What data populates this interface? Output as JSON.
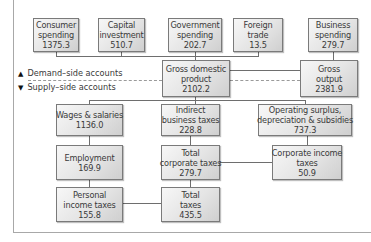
{
  "legend": {
    "demand": {
      "icon": "triangle-up-icon",
      "glyph": "▲",
      "label": "Demand–side accounts"
    },
    "supply": {
      "icon": "triangle-down-icon",
      "glyph": "▼",
      "label": "Supply–side accounts"
    }
  },
  "nodes": {
    "consumer_spending": {
      "line1": "Consumer",
      "line2": "spending",
      "value": "1375.3"
    },
    "capital_investment": {
      "line1": "Capital",
      "line2": "investment",
      "value": "510.7"
    },
    "government_spending": {
      "line1": "Government",
      "line2": "spending",
      "value": "202.7"
    },
    "foreign_trade": {
      "line1": "Foreign",
      "line2": "trade",
      "value": "13.5"
    },
    "business_spending": {
      "line1": "Business",
      "line2": "spending",
      "value": "279.7"
    },
    "gdp": {
      "line1": "Gross domestic",
      "line2": "product",
      "value": "2102.2"
    },
    "gross_output": {
      "line1": "Gross",
      "line2": "output",
      "value": "2381.9"
    },
    "wages_salaries": {
      "line1": "Wages & salaries",
      "value": "1136.0"
    },
    "indirect_business_taxes": {
      "line1": "Indirect",
      "line2": "business taxes",
      "value": "228.8"
    },
    "operating_surplus": {
      "line1": "Operating surplus,",
      "line2": "depreciation & subsidies",
      "value": "737.3"
    },
    "employment": {
      "line1": "Employment",
      "value": "169.9"
    },
    "total_corporate_taxes": {
      "line1": "Total",
      "line2": "corporate taxes",
      "value": "279.7"
    },
    "corporate_income_taxes": {
      "line1": "Corporate income",
      "line2": "taxes",
      "value": "50.9"
    },
    "personal_income_taxes": {
      "line1": "Personal",
      "line2": "income taxes",
      "value": "155.8"
    },
    "total_taxes": {
      "line1": "Total",
      "line2": "taxes",
      "value": "435.5"
    }
  },
  "colors": {
    "box_border": "#7a7a7a",
    "line": "#6e6e6e",
    "dash": "#9a9a9a",
    "text": "#3a3a3a"
  }
}
